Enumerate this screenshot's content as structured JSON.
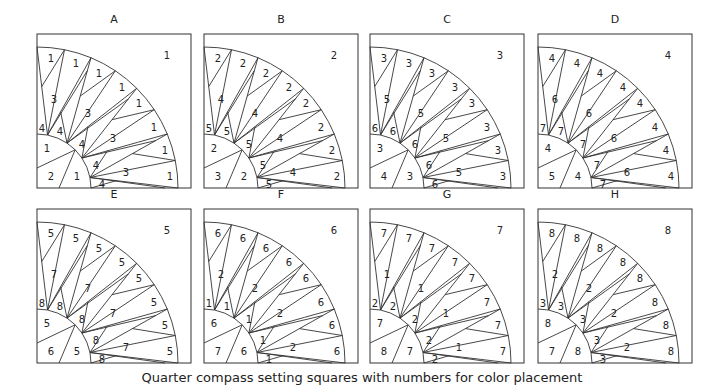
{
  "figure": {
    "caption": "Quarter compass setting squares with numbers for color placement",
    "panels": [
      {
        "label": "A",
        "corner": "1",
        "outer": "1",
        "spike": "3",
        "base": "4",
        "inner_top": "1",
        "inner_corner": "2",
        "inner_right": "1"
      },
      {
        "label": "B",
        "corner": "2",
        "outer": "2",
        "spike": "4",
        "base": "5",
        "inner_top": "2",
        "inner_corner": "3",
        "inner_right": "2"
      },
      {
        "label": "C",
        "corner": "3",
        "outer": "3",
        "spike": "5",
        "base": "6",
        "inner_top": "3",
        "inner_corner": "4",
        "inner_right": "3"
      },
      {
        "label": "D",
        "corner": "4",
        "outer": "4",
        "spike": "6",
        "base": "7",
        "inner_top": "4",
        "inner_corner": "5",
        "inner_right": "4"
      },
      {
        "label": "E",
        "corner": "5",
        "outer": "5",
        "spike": "7",
        "base": "8",
        "inner_top": "5",
        "inner_corner": "6",
        "inner_right": "5"
      },
      {
        "label": "F",
        "corner": "6",
        "outer": "6",
        "spike": "2",
        "base": "1",
        "inner_top": "6",
        "inner_corner": "7",
        "inner_right": "6"
      },
      {
        "label": "G",
        "corner": "7",
        "outer": "7",
        "spike": "1",
        "base": "2",
        "inner_top": "7",
        "inner_corner": "8",
        "inner_right": "7"
      },
      {
        "label": "H",
        "corner": "8",
        "outer": "8",
        "spike": "2",
        "base": "3",
        "inner_top": "8",
        "inner_corner": "7",
        "inner_right": "8"
      }
    ]
  }
}
